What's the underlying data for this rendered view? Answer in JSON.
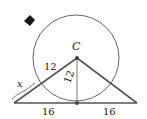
{
  "diagram": {
    "marker_icon": "diamond-bullet-icon",
    "center_label": "C",
    "segment_labels": {
      "slant": "12",
      "radius": "12",
      "external": "x",
      "base_left": "16",
      "base_right": "16"
    },
    "colors": {
      "stroke": "#555555",
      "circle": "#666666",
      "marker": "#1a1a1a"
    }
  }
}
